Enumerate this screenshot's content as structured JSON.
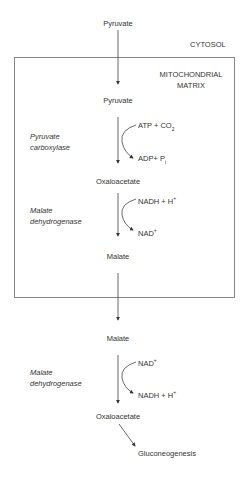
{
  "diagram": {
    "compartments": {
      "outer": "CYTOSOL",
      "inner_line1": "MITOCHONDRIAL",
      "inner_line2": "MATRIX"
    },
    "metabolites": {
      "pyruvate_cytosol": "Pyruvate",
      "pyruvate_matrix": "Pyruvate",
      "oxaloacetate_matrix": "Oxaloacetate",
      "malate_matrix": "Malate",
      "malate_cytosol": "Malate",
      "oxaloacetate_cytosol": "Oxaloacetate",
      "gluconeogenesis": "Gluconeogenesis"
    },
    "enzymes": {
      "pyruvate_carboxylase_line1": "Pyruvate",
      "pyruvate_carboxylase_line2": "carboxylase",
      "mdh_matrix_line1": "Malate",
      "mdh_matrix_line2": "dehydrogenase",
      "mdh_cytosol_line1": "Malate",
      "mdh_cytosol_line2": "dehydrogenase"
    },
    "cofactors": {
      "step1_in": "ATP + CO",
      "step1_in_sub": "2",
      "step1_out": "ADP+ P",
      "step1_out_sub": "i",
      "step2_in": "NADH + H",
      "step2_in_sup": "+",
      "step2_out": "NAD",
      "step2_out_sup": "+",
      "step3_in": "NAD",
      "step3_in_sup": "+",
      "step3_out": "NADH + H",
      "step3_out_sup": "+"
    },
    "colors": {
      "line": "#555555",
      "text": "#333333",
      "box": "#888888"
    }
  }
}
